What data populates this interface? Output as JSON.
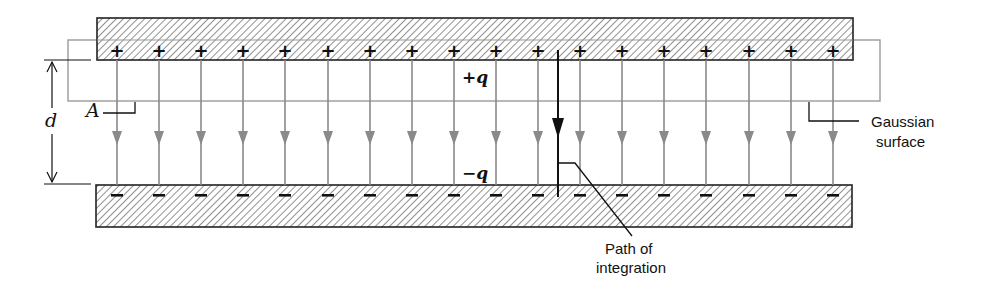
{
  "figure": {
    "colors": {
      "plate_outline": "#222222",
      "hatch": "#555555",
      "field_line": "#8a8a8a",
      "gaussian_surface": "#9a9a9a",
      "path_of_integration": "#111111",
      "text": "#111111",
      "background": "#ffffff"
    },
    "top_plate": {
      "charge_label": "+q",
      "charge_symbol": "+",
      "x": 97,
      "y": 18,
      "width": 756,
      "height": 42
    },
    "bottom_plate": {
      "charge_label": "−q",
      "charge_symbol": "−",
      "x": 96,
      "y": 185,
      "width": 756,
      "height": 42
    },
    "field_lines": {
      "count": 18,
      "x_start": 117,
      "spacing": 42.1,
      "y_top": 60,
      "y_bottom": 185,
      "arrow_y": 145,
      "direction": "down"
    },
    "gaussian_surface": {
      "label_line1": "Gaussian",
      "label_line2": "surface",
      "x": 68,
      "y": 40,
      "width": 812,
      "height": 61
    },
    "area_label": {
      "text": "A"
    },
    "separation_label": {
      "text": "d"
    },
    "path_of_integration": {
      "label_line1": "Path of",
      "label_line2": "integration",
      "x": 558,
      "y_top": 50,
      "y_bottom": 197
    }
  }
}
